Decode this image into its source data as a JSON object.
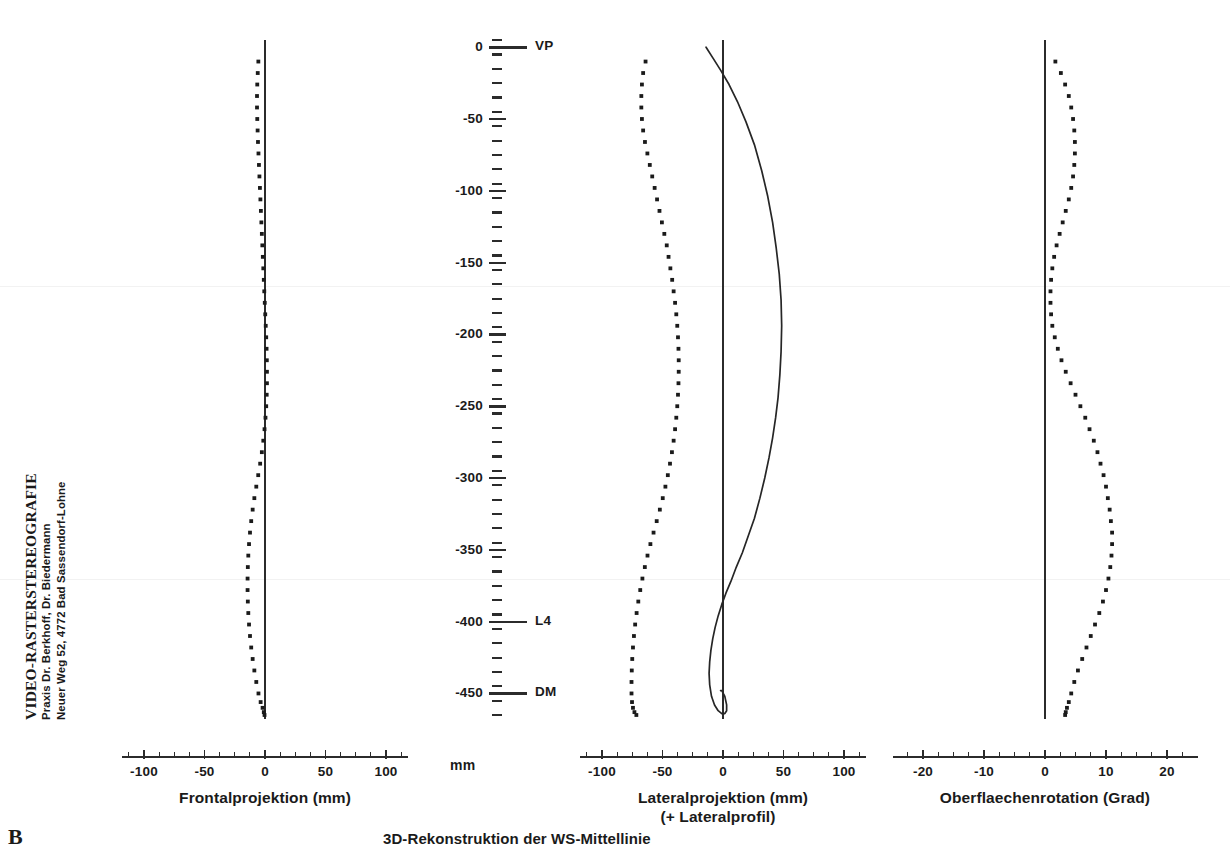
{
  "header": {
    "title": "VIDEO-RASTERSTEREOGRAFIE",
    "line2": "Praxis Dr. Berkhoff, Dr. Biedermann",
    "line3": "Neuer Weg 52, 4772 Bad Sassendorf-Lohne"
  },
  "figure": {
    "panel_label": "B",
    "caption": "3D-Rekonstruktion der WS-Mittellinie"
  },
  "ruler": {
    "unit": "mm",
    "major_ticks": [
      {
        "value": 0,
        "label": "0",
        "name": "VP"
      },
      {
        "value": -50,
        "label": "-50",
        "name": ""
      },
      {
        "value": -100,
        "label": "-100",
        "name": ""
      },
      {
        "value": -150,
        "label": "-150",
        "name": ""
      },
      {
        "value": -200,
        "label": "-200",
        "name": ""
      },
      {
        "value": -250,
        "label": "-250",
        "name": ""
      },
      {
        "value": -300,
        "label": "-300",
        "name": ""
      },
      {
        "value": -350,
        "label": "-350",
        "name": ""
      },
      {
        "value": -400,
        "label": "-400",
        "name": "L4"
      },
      {
        "value": -450,
        "label": "-450",
        "name": "DM"
      }
    ],
    "minor_step": 10,
    "range": [
      -465,
      5
    ]
  },
  "chart_data": [
    {
      "id": "frontal",
      "type": "line",
      "title": "Frontalprojektion (mm)",
      "xlabel": "Frontalprojektion (mm)",
      "ylabel": "mm",
      "style": "dotted",
      "xlim": [
        -125,
        125
      ],
      "ylim": [
        -465,
        5
      ],
      "xticks": [
        -100,
        -50,
        0,
        50,
        100
      ],
      "xticklabels": [
        "-100",
        "-50",
        "0",
        "50",
        "100"
      ],
      "xminor_step": 12.5,
      "grid": false,
      "x": [
        -5.5,
        -6.0,
        -6.4,
        -6.6,
        -6.6,
        -6.4,
        -6.1,
        -5.8,
        -5.4,
        -5.0,
        -4.6,
        -4.2,
        -3.8,
        -3.4,
        -3.0,
        -2.6,
        -2.2,
        -1.8,
        -1.4,
        -1.0,
        -0.6,
        -0.2,
        0.2,
        0.6,
        1.0,
        1.3,
        1.5,
        1.6,
        1.6,
        1.4,
        1.0,
        0.4,
        -0.4,
        -1.4,
        -2.6,
        -4.0,
        -5.6,
        -7.2,
        -8.8,
        -10.2,
        -11.4,
        -12.4,
        -13.2,
        -13.8,
        -14.2,
        -14.4,
        -14.4,
        -14.2,
        -13.8,
        -13.2,
        -12.4,
        -11.4,
        -10.2,
        -8.8,
        -7.2,
        -5.4,
        -3.6,
        -2.0,
        -1.0,
        -0.4
      ],
      "y": [
        -10,
        -18,
        -26,
        -34,
        -42,
        -50,
        -58,
        -66,
        -74,
        -82,
        -90,
        -98,
        -106,
        -114,
        -122,
        -130,
        -138,
        -146,
        -154,
        -162,
        -170,
        -178,
        -186,
        -194,
        -202,
        -210,
        -218,
        -226,
        -234,
        -242,
        -250,
        -258,
        -266,
        -274,
        -282,
        -290,
        -298,
        -306,
        -314,
        -322,
        -330,
        -338,
        -346,
        -354,
        -362,
        -370,
        -378,
        -386,
        -394,
        -402,
        -410,
        -418,
        -426,
        -434,
        -442,
        -450,
        -456,
        -460,
        -463,
        -465
      ]
    },
    {
      "id": "lateral",
      "type": "line",
      "title": "Lateralprojektion (mm)",
      "xlabel": "Lateralprojektion (mm)",
      "xlabel2": "(+ Lateralprofil)",
      "ylabel": "mm",
      "style": "dotted+solid",
      "xlim": [
        -125,
        125
      ],
      "ylim": [
        -465,
        5
      ],
      "xticks": [
        -100,
        -50,
        0,
        50,
        100
      ],
      "xticklabels": [
        "-100",
        "-50",
        "0",
        "50",
        "100"
      ],
      "xminor_step": 12.5,
      "grid": false,
      "series": [
        {
          "name": "Lateralprojektion",
          "style": "dotted",
          "x": [
            -64,
            -66,
            -67,
            -67.5,
            -67.5,
            -67,
            -66,
            -64.5,
            -62.5,
            -60.5,
            -58.5,
            -56.5,
            -54.5,
            -52.5,
            -50.5,
            -48.5,
            -46.5,
            -45,
            -43.5,
            -42,
            -40.8,
            -39.6,
            -38.6,
            -37.8,
            -37.2,
            -36.8,
            -36.6,
            -36.6,
            -36.8,
            -37.2,
            -37.8,
            -38.6,
            -39.6,
            -40.8,
            -42.2,
            -43.8,
            -45.6,
            -47.6,
            -49.8,
            -52.2,
            -54.8,
            -57.4,
            -60.0,
            -62.4,
            -64.6,
            -66.6,
            -68.4,
            -70.0,
            -71.4,
            -72.6,
            -73.6,
            -74.4,
            -75.0,
            -75.4,
            -75.6,
            -75.6,
            -75.2,
            -74.4,
            -73.2,
            -71.6
          ],
          "y": [
            -10,
            -18,
            -26,
            -34,
            -42,
            -50,
            -58,
            -66,
            -74,
            -82,
            -90,
            -98,
            -106,
            -114,
            -122,
            -130,
            -138,
            -146,
            -154,
            -162,
            -170,
            -178,
            -186,
            -194,
            -202,
            -210,
            -218,
            -226,
            -234,
            -242,
            -250,
            -258,
            -266,
            -274,
            -282,
            -290,
            -298,
            -306,
            -314,
            -322,
            -330,
            -338,
            -346,
            -354,
            -362,
            -370,
            -378,
            -386,
            -394,
            -402,
            -410,
            -418,
            -426,
            -434,
            -442,
            -450,
            -456,
            -460,
            -463,
            -465
          ]
        },
        {
          "name": "Lateralprofil",
          "style": "solid",
          "x": [
            -14,
            -8,
            -2,
            5,
            12,
            19,
            26,
            32,
            37,
            41,
            44,
            46.5,
            48,
            48.5,
            48,
            47,
            45.5,
            43.5,
            41,
            38,
            34.5,
            30.5,
            26,
            21,
            16,
            11,
            6.5,
            2.5,
            -1,
            -4,
            -6.5,
            -8.5,
            -10,
            -11,
            -11.5,
            -11,
            -9.5,
            -7,
            -4,
            -1,
            1.5,
            3,
            3,
            1.5,
            -1,
            -2
          ],
          "y": [
            0,
            -8,
            -16,
            -26,
            -38,
            -52,
            -68,
            -86,
            -104,
            -122,
            -140,
            -158,
            -176,
            -194,
            -212,
            -228,
            -244,
            -258,
            -272,
            -286,
            -300,
            -314,
            -328,
            -340,
            -352,
            -362,
            -372,
            -380,
            -388,
            -396,
            -404,
            -412,
            -420,
            -428,
            -436,
            -444,
            -452,
            -458,
            -462,
            -464,
            -464,
            -462,
            -458,
            -452,
            -448,
            -448
          ]
        }
      ]
    },
    {
      "id": "rotation",
      "type": "line",
      "title": "Oberflaechenrotation (Grad)",
      "xlabel": "Oberflaechenrotation (Grad)",
      "ylabel": "mm",
      "style": "dotted",
      "xlim": [
        -25,
        25
      ],
      "ylim": [
        -465,
        5
      ],
      "xticks": [
        -20,
        -10,
        0,
        10,
        20
      ],
      "xticklabels": [
        "-20",
        "-10",
        "0",
        "10",
        "20"
      ],
      "xminor_step": 2.5,
      "grid": false,
      "x": [
        1.7,
        2.6,
        3.3,
        3.9,
        4.3,
        4.6,
        4.8,
        4.9,
        4.9,
        4.8,
        4.6,
        4.3,
        3.9,
        3.4,
        2.9,
        2.4,
        1.9,
        1.5,
        1.2,
        1.0,
        0.9,
        0.9,
        1.0,
        1.2,
        1.6,
        2.1,
        2.7,
        3.4,
        4.2,
        5.0,
        5.8,
        6.6,
        7.3,
        8.0,
        8.6,
        9.1,
        9.6,
        10.0,
        10.3,
        10.6,
        10.8,
        11.0,
        11.0,
        10.9,
        10.7,
        10.4,
        10.0,
        9.5,
        8.9,
        8.2,
        7.5,
        6.8,
        6.1,
        5.4,
        4.8,
        4.3,
        3.9,
        3.6,
        3.4,
        3.3
      ],
      "y": [
        -10,
        -18,
        -26,
        -34,
        -42,
        -50,
        -58,
        -66,
        -74,
        -82,
        -90,
        -98,
        -106,
        -114,
        -122,
        -130,
        -138,
        -146,
        -154,
        -162,
        -170,
        -178,
        -186,
        -194,
        -202,
        -210,
        -218,
        -226,
        -234,
        -242,
        -250,
        -258,
        -266,
        -274,
        -282,
        -290,
        -298,
        -306,
        -314,
        -322,
        -330,
        -338,
        -346,
        -354,
        -362,
        -370,
        -378,
        -386,
        -394,
        -402,
        -410,
        -418,
        -426,
        -434,
        -442,
        -450,
        -456,
        -460,
        -463,
        -465
      ]
    }
  ],
  "panel_geometry": {
    "frontal": {
      "x0": 265,
      "xscale": 1.21,
      "left": 122,
      "right": 408
    },
    "lateral": {
      "x0": 723,
      "xscale": 1.21,
      "left": 580,
      "right": 866
    },
    "rotation": {
      "x0": 1045,
      "xscale": 6.1,
      "left": 893,
      "right": 1198
    },
    "axis_y": 756,
    "plot_top": 40,
    "plot_bottom": 715,
    "ruler_x": 497,
    "y_top_value": 5,
    "y_bottom_value": -465
  }
}
